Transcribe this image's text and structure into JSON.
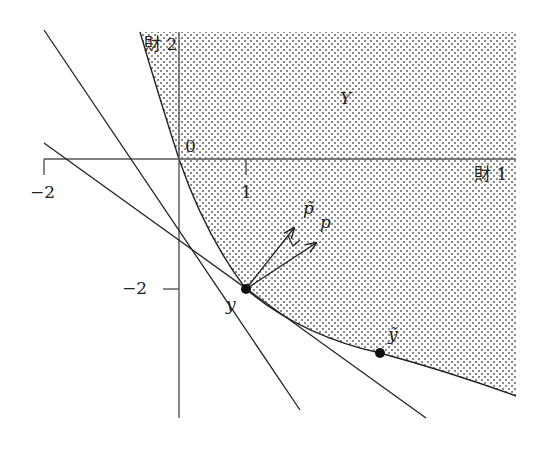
{
  "figure": {
    "type": "production-set-diagram",
    "axes": {
      "x_label": "財 1",
      "y_label": "財 2",
      "origin_label": "0",
      "x_ticks": [
        {
          "value": -2,
          "label": "−2"
        },
        {
          "value": 1,
          "label": "1"
        }
      ],
      "y_ticks": [
        {
          "value": -2,
          "label": "−2"
        }
      ]
    },
    "region_label": "Y",
    "points": [
      {
        "name": "y",
        "label": "y",
        "coords": [
          1,
          -2
        ]
      },
      {
        "name": "y_tilde",
        "label": "ỹ",
        "coords": [
          3,
          -3
        ]
      }
    ],
    "vectors": [
      {
        "name": "p_tilde",
        "label": "p̃"
      },
      {
        "name": "p",
        "label": "p"
      }
    ],
    "lines": [
      {
        "name": "hyperplane-p-tilde",
        "description": "steeper supporting line through y"
      },
      {
        "name": "hyperplane-p",
        "description": "flatter supporting line through y"
      }
    ],
    "colors": {
      "ink": "#222222",
      "axis": "#555555",
      "dot_fill": "#888888"
    }
  }
}
